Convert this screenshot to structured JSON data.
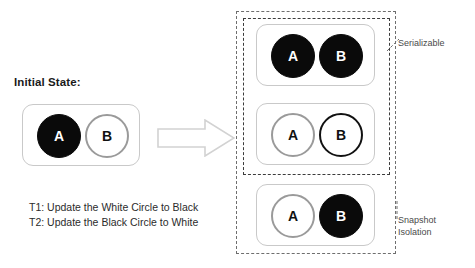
{
  "diagram": {
    "title_label": "Initial State:",
    "transactions": [
      "T1: Update the White Circle to Black",
      "T2: Update the Black Circle to White"
    ],
    "arrow_icon": "right-arrow-icon",
    "initial_state": {
      "circles": [
        {
          "label": "A",
          "fill": "black"
        },
        {
          "label": "B",
          "fill": "white"
        }
      ]
    },
    "outcomes": [
      {
        "name": "both-black",
        "circles": [
          {
            "label": "A",
            "fill": "black"
          },
          {
            "label": "B",
            "fill": "black"
          }
        ]
      },
      {
        "name": "both-white",
        "circles": [
          {
            "label": "A",
            "fill": "white"
          },
          {
            "label": "B",
            "fill": "white"
          }
        ]
      },
      {
        "name": "swapped",
        "circles": [
          {
            "label": "A",
            "fill": "white"
          },
          {
            "label": "B",
            "fill": "black"
          }
        ]
      }
    ],
    "groups": {
      "serializable_label": "Serializable",
      "snapshot_label_line1": "Snapshot",
      "snapshot_label_line2": "Isolation"
    },
    "colors": {
      "black_fill": "#0a0a0a",
      "white_fill": "#ffffff",
      "gray_outline": "#9a9a9a",
      "black_outline": "#111111",
      "box_border": "#c9c9c9",
      "dash_inner": "#3c3c3c",
      "dash_outer": "#6e6e6e",
      "arrow_outline": "#d2d2d2",
      "text": "#2b2b2b"
    }
  }
}
